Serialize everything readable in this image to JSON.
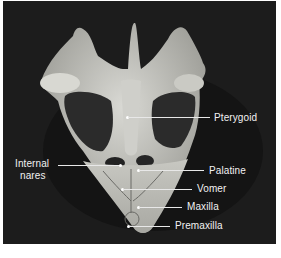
{
  "figure": {
    "background_color": "#1c1c1c",
    "label_color": "#f2f2f2",
    "labels": [
      {
        "id": "pterygoid",
        "text": "Pterygoid"
      },
      {
        "id": "internal_nares",
        "text_line1": "Internal",
        "text_line2": "nares"
      },
      {
        "id": "palatine",
        "text": "Palatine"
      },
      {
        "id": "vomer",
        "text": "Vomer"
      },
      {
        "id": "maxilla",
        "text": "Maxilla"
      },
      {
        "id": "premaxilla",
        "text": "Premaxilla"
      }
    ]
  }
}
